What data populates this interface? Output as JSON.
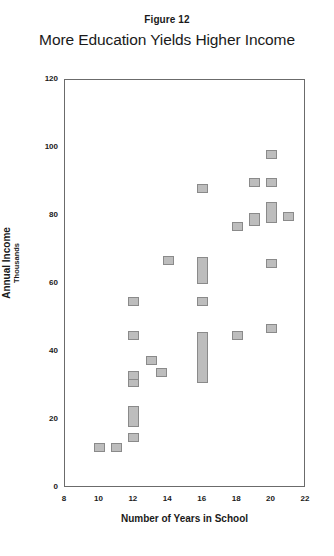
{
  "figure": {
    "number_label": "Figure 12",
    "title": "More Education Yields Higher Income"
  },
  "chart_data": {
    "type": "scatter",
    "title": "More Education Yields Higher Income",
    "subtitle": "Figure 12",
    "xlabel": "Number of Years in School",
    "ylabel": "Annual Income",
    "ylabel_units": "Thousands",
    "xlim": [
      8,
      22
    ],
    "ylim": [
      0,
      120
    ],
    "xticks": [
      8,
      10,
      12,
      14,
      16,
      18,
      20,
      22
    ],
    "xtick_labels": [
      "8",
      "10",
      "12",
      "14",
      "16",
      "18",
      "20",
      "22"
    ],
    "yticks": [
      0,
      20,
      40,
      60,
      80,
      100,
      120
    ],
    "ytick_labels": [
      "0",
      "20",
      "40",
      "60",
      "80",
      "100",
      "120"
    ],
    "grid": false,
    "legend": null,
    "marker_fill": "#bdbdbd",
    "marker_edge": "#8a8a8a",
    "axis_color": "#6b6b6b",
    "points": [
      {
        "x": 10.0,
        "y": 12,
        "y_low": 11,
        "y_high": 13
      },
      {
        "x": 11.0,
        "y": 12,
        "y_low": 11,
        "y_high": 13
      },
      {
        "x": 12.0,
        "y": 15,
        "y_low": 14,
        "y_high": 16
      },
      {
        "x": 12.0,
        "y": 21,
        "y_low": 18,
        "y_high": 24
      },
      {
        "x": 12.0,
        "y": 31,
        "y_low": 30,
        "y_high": 32
      },
      {
        "x": 12.0,
        "y": 33,
        "y_low": 32,
        "y_high": 34
      },
      {
        "x": 12.0,
        "y": 45,
        "y_low": 44,
        "y_high": 46
      },
      {
        "x": 12.0,
        "y": 55,
        "y_low": 54,
        "y_high": 56
      },
      {
        "x": 13.0,
        "y": 37.5,
        "y_low": 36.5,
        "y_high": 38.5
      },
      {
        "x": 13.6,
        "y": 34,
        "y_low": 33,
        "y_high": 35
      },
      {
        "x": 14.0,
        "y": 67,
        "y_low": 66,
        "y_high": 68
      },
      {
        "x": 16.0,
        "y": 38.5,
        "y_low": 31,
        "y_high": 46
      },
      {
        "x": 16.0,
        "y": 55,
        "y_low": 54,
        "y_high": 56
      },
      {
        "x": 16.0,
        "y": 64,
        "y_low": 60,
        "y_high": 68
      },
      {
        "x": 16.0,
        "y": 88,
        "y_low": 87,
        "y_high": 89
      },
      {
        "x": 18.0,
        "y": 45,
        "y_low": 44,
        "y_high": 46
      },
      {
        "x": 18.0,
        "y": 77,
        "y_low": 76,
        "y_high": 78
      },
      {
        "x": 19.0,
        "y": 79,
        "y_low": 77,
        "y_high": 81
      },
      {
        "x": 19.0,
        "y": 90,
        "y_low": 89,
        "y_high": 91
      },
      {
        "x": 20.0,
        "y": 47,
        "y_low": 46,
        "y_high": 48
      },
      {
        "x": 20.0,
        "y": 66,
        "y_low": 65,
        "y_high": 67
      },
      {
        "x": 20.0,
        "y": 81,
        "y_low": 78,
        "y_high": 84
      },
      {
        "x": 20.0,
        "y": 90,
        "y_low": 89,
        "y_high": 91
      },
      {
        "x": 20.0,
        "y": 98,
        "y_low": 97,
        "y_high": 99
      },
      {
        "x": 21.0,
        "y": 80,
        "y_low": 79,
        "y_high": 81
      }
    ]
  }
}
